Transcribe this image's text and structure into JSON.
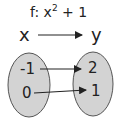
{
  "title": {
    "prefix": "f: x",
    "exponent": "2",
    "suffix": " + 1"
  },
  "domain_label": "x",
  "codomain_label": "y",
  "domain_values": [
    "-1",
    "0"
  ],
  "codomain_values": [
    "2",
    "1"
  ],
  "mappings": [
    {
      "from": "-1",
      "to": "2"
    },
    {
      "from": "0",
      "to": "1"
    }
  ],
  "colors": {
    "ellipse_fill": "#d3d3d3",
    "ellipse_stroke": "#555555",
    "text": "#222222"
  }
}
